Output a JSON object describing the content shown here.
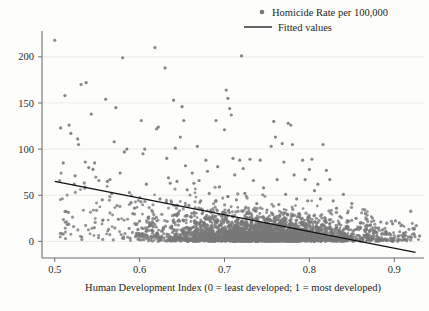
{
  "chart_data": {
    "type": "scatter",
    "title": "",
    "subtitle": "",
    "xlabel": "Human Development Index (0 = least developed; 1 = most developed)",
    "ylabel": "",
    "xlim": [
      0.485,
      0.935
    ],
    "ylim": [
      -18,
      228
    ],
    "xticks": [
      "0.5",
      "0.6",
      "0.7",
      "0.8",
      "0.9"
    ],
    "xtick_values": [
      0.5,
      0.6,
      0.7,
      0.8,
      0.9
    ],
    "yticks": [
      "0",
      "50",
      "100",
      "150",
      "200"
    ],
    "ytick_values": [
      0,
      50,
      100,
      150,
      200
    ],
    "grid": "horizontal",
    "legend_position": "top-right",
    "legend": [
      {
        "label": "Homicide Rate per 100,000",
        "marker": "dot",
        "color": "#787878"
      },
      {
        "label": "Fitted values",
        "marker": "line",
        "color": "#111111"
      }
    ],
    "series": [
      {
        "name": "Homicide Rate per 100,000",
        "marker": "dot",
        "color": "#787878",
        "marker_size": 3.0,
        "points": [
          [
            0.5,
            218
          ],
          [
            0.507,
            123
          ],
          [
            0.51,
            85
          ],
          [
            0.512,
            158
          ],
          [
            0.517,
            126
          ],
          [
            0.519,
            117
          ],
          [
            0.523,
            62
          ],
          [
            0.524,
            71
          ],
          [
            0.527,
            111
          ],
          [
            0.528,
            105
          ],
          [
            0.531,
            170
          ],
          [
            0.536,
            86
          ],
          [
            0.537,
            172
          ],
          [
            0.54,
            80
          ],
          [
            0.543,
            138
          ],
          [
            0.545,
            78
          ],
          [
            0.547,
            85
          ],
          [
            0.552,
            66
          ],
          [
            0.556,
            45
          ],
          [
            0.56,
            154
          ],
          [
            0.562,
            65
          ],
          [
            0.565,
            67
          ],
          [
            0.567,
            52
          ],
          [
            0.57,
            108
          ],
          [
            0.572,
            145
          ],
          [
            0.575,
            24
          ],
          [
            0.577,
            74
          ],
          [
            0.58,
            199
          ],
          [
            0.582,
            97
          ],
          [
            0.585,
            100
          ],
          [
            0.588,
            53
          ],
          [
            0.59,
            42
          ],
          [
            0.592,
            30
          ],
          [
            0.594,
            36
          ],
          [
            0.596,
            18
          ],
          [
            0.598,
            13
          ],
          [
            0.6,
            22
          ],
          [
            0.602,
            131
          ],
          [
            0.604,
            95
          ],
          [
            0.606,
            100
          ],
          [
            0.608,
            62
          ],
          [
            0.61,
            26
          ],
          [
            0.612,
            19
          ],
          [
            0.614,
            12
          ],
          [
            0.616,
            16
          ],
          [
            0.618,
            210
          ],
          [
            0.62,
            122
          ],
          [
            0.622,
            124
          ],
          [
            0.624,
            46
          ],
          [
            0.626,
            11
          ],
          [
            0.628,
            15
          ],
          [
            0.63,
            188
          ],
          [
            0.632,
            90
          ],
          [
            0.634,
            69
          ],
          [
            0.636,
            63
          ],
          [
            0.638,
            14
          ],
          [
            0.64,
            153
          ],
          [
            0.642,
            101
          ],
          [
            0.644,
            65
          ],
          [
            0.646,
            23
          ],
          [
            0.648,
            113
          ],
          [
            0.65,
            146
          ],
          [
            0.652,
            131
          ],
          [
            0.654,
            82
          ],
          [
            0.656,
            56
          ],
          [
            0.658,
            39
          ],
          [
            0.66,
            27
          ],
          [
            0.662,
            74
          ],
          [
            0.664,
            63
          ],
          [
            0.666,
            21
          ],
          [
            0.668,
            103
          ],
          [
            0.67,
            66
          ],
          [
            0.672,
            44
          ],
          [
            0.674,
            31
          ],
          [
            0.676,
            18
          ],
          [
            0.678,
            88
          ],
          [
            0.68,
            76
          ],
          [
            0.682,
            52
          ],
          [
            0.684,
            34
          ],
          [
            0.686,
            12
          ],
          [
            0.69,
            131
          ],
          [
            0.692,
            81
          ],
          [
            0.694,
            59
          ],
          [
            0.696,
            28
          ],
          [
            0.698,
            10
          ],
          [
            0.7,
            121
          ],
          [
            0.702,
            164
          ],
          [
            0.704,
            155
          ],
          [
            0.706,
            144
          ],
          [
            0.708,
            137
          ],
          [
            0.71,
            90
          ],
          [
            0.712,
            72
          ],
          [
            0.714,
            45
          ],
          [
            0.716,
            24
          ],
          [
            0.718,
            88
          ],
          [
            0.72,
            201
          ],
          [
            0.722,
            79
          ],
          [
            0.724,
            52
          ],
          [
            0.726,
            30
          ],
          [
            0.73,
            89
          ],
          [
            0.734,
            66
          ],
          [
            0.738,
            41
          ],
          [
            0.742,
            88
          ],
          [
            0.746,
            58
          ],
          [
            0.75,
            34
          ],
          [
            0.755,
            103
          ],
          [
            0.758,
            130
          ],
          [
            0.76,
            113
          ],
          [
            0.762,
            67
          ],
          [
            0.764,
            40
          ],
          [
            0.768,
            106
          ],
          [
            0.77,
            86
          ],
          [
            0.772,
            51
          ],
          [
            0.775,
            128
          ],
          [
            0.778,
            126
          ],
          [
            0.78,
            105
          ],
          [
            0.782,
            72
          ],
          [
            0.785,
            46
          ],
          [
            0.788,
            30
          ],
          [
            0.792,
            88
          ],
          [
            0.795,
            67
          ],
          [
            0.798,
            44
          ],
          [
            0.8,
            78
          ],
          [
            0.803,
            89
          ],
          [
            0.806,
            55
          ],
          [
            0.81,
            62
          ],
          [
            0.813,
            46
          ],
          [
            0.816,
            105
          ],
          [
            0.82,
            77
          ],
          [
            0.824,
            67
          ],
          [
            0.828,
            44
          ],
          [
            0.832,
            36
          ],
          [
            0.836,
            27
          ],
          [
            0.84,
            51
          ],
          [
            0.845,
            31
          ],
          [
            0.85,
            41
          ],
          [
            0.855,
            25
          ],
          [
            0.86,
            20
          ],
          [
            0.866,
            30
          ],
          [
            0.872,
            18
          ],
          [
            0.878,
            15
          ],
          [
            0.884,
            21
          ],
          [
            0.89,
            11
          ],
          [
            0.898,
            19
          ],
          [
            0.906,
            20
          ],
          [
            0.912,
            2
          ],
          [
            0.922,
            14
          ]
        ],
        "cluster_note": "Several thousand additional observations form a dense band from HDI 0.60 to 0.88 with homicide rates between 0 and 45, densest between 0.68 and 0.82 near 0-20."
      },
      {
        "name": "Fitted values",
        "marker": "line",
        "color": "#111111",
        "endpoints": [
          [
            0.5,
            65
          ],
          [
            0.925,
            -12
          ]
        ],
        "slope": -181,
        "intercept": 155
      }
    ]
  }
}
